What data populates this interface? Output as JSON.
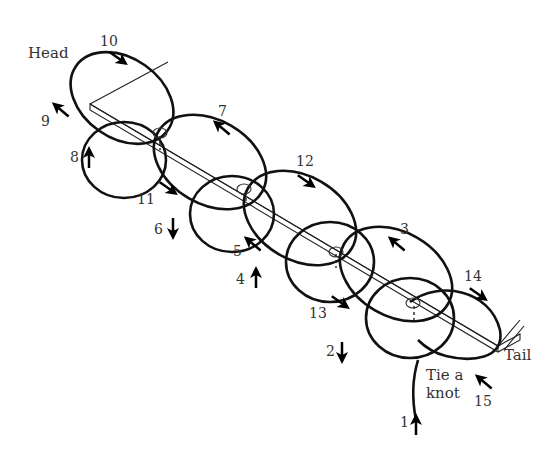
{
  "diagram": {
    "type": "knot-lacing-sequence",
    "labels": {
      "head": "Head",
      "tail": "Tail",
      "start_line1": "Tie a",
      "start_line2": "knot"
    },
    "steps": [
      {
        "n": "1",
        "x": 404,
        "y": 424,
        "label_x": 400,
        "label_y": 427,
        "ax": 416,
        "ay": 425,
        "dir": "up"
      },
      {
        "n": "2",
        "x": 330,
        "y": 352,
        "label_x": 326,
        "label_y": 356,
        "ax": 342,
        "ay": 352,
        "dir": "down"
      },
      {
        "n": "3",
        "x": 405,
        "y": 230,
        "label_x": 400,
        "label_y": 234,
        "ax": 397,
        "ay": 244,
        "dir": "up-left"
      },
      {
        "n": "4",
        "x": 240,
        "y": 280,
        "label_x": 236,
        "label_y": 284,
        "ax": 256,
        "ay": 278,
        "dir": "up"
      },
      {
        "n": "5",
        "x": 236,
        "y": 252,
        "label_x": 233,
        "label_y": 256,
        "ax": 253,
        "ay": 244,
        "dir": "up-left"
      },
      {
        "n": "6",
        "x": 158,
        "y": 230,
        "label_x": 154,
        "label_y": 234,
        "ax": 173,
        "ay": 228,
        "dir": "down"
      },
      {
        "n": "7",
        "x": 222,
        "y": 112,
        "label_x": 218,
        "label_y": 116,
        "ax": 222,
        "ay": 128,
        "dir": "up-left"
      },
      {
        "n": "8",
        "x": 74,
        "y": 158,
        "label_x": 70,
        "label_y": 162,
        "ax": 89,
        "ay": 158,
        "dir": "up"
      },
      {
        "n": "9",
        "x": 45,
        "y": 122,
        "label_x": 41,
        "label_y": 126,
        "ax": 61,
        "ay": 110,
        "dir": "up-left"
      },
      {
        "n": "10",
        "x": 112,
        "y": 42,
        "label_x": 104,
        "label_y": 46,
        "ax": 118,
        "ay": 58,
        "dir": "down-right"
      },
      {
        "n": "11",
        "x": 148,
        "y": 200,
        "label_x": 141,
        "label_y": 204,
        "ax": 168,
        "ay": 188,
        "dir": "down-right"
      },
      {
        "n": "12",
        "x": 308,
        "y": 162,
        "label_x": 300,
        "label_y": 166,
        "ax": 306,
        "ay": 181,
        "dir": "down-right"
      },
      {
        "n": "13",
        "x": 320,
        "y": 314,
        "label_x": 313,
        "label_y": 318,
        "ax": 340,
        "ay": 302,
        "dir": "down-right"
      },
      {
        "n": "14",
        "x": 476,
        "y": 277,
        "label_x": 468,
        "label_y": 281,
        "ax": 478,
        "ay": 294,
        "dir": "down-right"
      },
      {
        "n": "15",
        "x": 486,
        "y": 402,
        "label_x": 478,
        "label_y": 406,
        "ax": 484,
        "ay": 382,
        "dir": "up-left"
      }
    ]
  }
}
